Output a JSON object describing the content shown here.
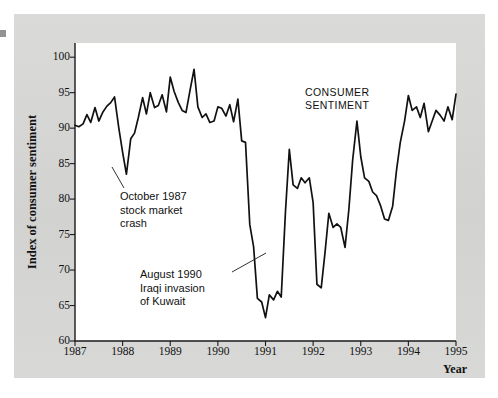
{
  "figure": {
    "background_color": "#d6d6d4",
    "plot_background_color": "#ffffff",
    "line_color": "#111111"
  },
  "annotations": {
    "crash_1987": "October 1987\nstock market\ncrash",
    "crash_1987_lines": [
      "October 1987",
      "stock market",
      "crash"
    ],
    "gulf_1990": "August 1990\nIraqi invasion\nof Kuwait",
    "gulf_1990_lines": [
      "August 1990",
      "Iraqi invasion",
      "of Kuwait"
    ],
    "series_label_lines": [
      "CONSUMER",
      "SENTIMENT"
    ]
  },
  "chart_data": {
    "type": "line",
    "title": "",
    "xlabel": "Year",
    "ylabel": "Index of consumer sentiment",
    "series_name": "CONSUMER SENTIMENT",
    "xlim": [
      1987.0,
      1995.0
    ],
    "ylim": [
      60,
      102
    ],
    "ytick_labels": [
      "60",
      "65",
      "70",
      "75",
      "80",
      "85",
      "90",
      "95",
      "100"
    ],
    "yticks": [
      60,
      65,
      70,
      75,
      80,
      85,
      90,
      95,
      100
    ],
    "xtick_labels": [
      "1987",
      "1988",
      "1989",
      "1990",
      "1991",
      "1992",
      "1993",
      "1994",
      "1995"
    ],
    "xticks": [
      1987,
      1988,
      1989,
      1990,
      1991,
      1992,
      1993,
      1994,
      1995
    ],
    "grid": false,
    "legend": "inline-label",
    "x": [
      1987.0,
      1987.08,
      1987.17,
      1987.25,
      1987.33,
      1987.42,
      1987.5,
      1987.58,
      1987.67,
      1987.75,
      1987.83,
      1987.92,
      1988.0,
      1988.08,
      1988.17,
      1988.25,
      1988.33,
      1988.42,
      1988.5,
      1988.58,
      1988.67,
      1988.75,
      1988.83,
      1988.92,
      1989.0,
      1989.08,
      1989.17,
      1989.25,
      1989.33,
      1989.42,
      1989.5,
      1989.58,
      1989.67,
      1989.75,
      1989.83,
      1989.92,
      1990.0,
      1990.08,
      1990.17,
      1990.25,
      1990.33,
      1990.42,
      1990.5,
      1990.58,
      1990.67,
      1990.75,
      1990.83,
      1990.92,
      1991.0,
      1991.08,
      1991.17,
      1991.25,
      1991.33,
      1991.42,
      1991.5,
      1991.58,
      1991.67,
      1991.75,
      1991.83,
      1991.92,
      1992.0,
      1992.08,
      1992.17,
      1992.25,
      1992.33,
      1992.42,
      1992.5,
      1992.58,
      1992.67,
      1992.75,
      1992.83,
      1992.92,
      1993.0,
      1993.08,
      1993.17,
      1993.25,
      1993.33,
      1993.42,
      1993.5,
      1993.58,
      1993.67,
      1993.75,
      1993.83,
      1993.92,
      1994.0,
      1994.08,
      1994.17,
      1994.25,
      1994.33,
      1994.42,
      1994.5,
      1994.58,
      1994.67,
      1994.75,
      1994.83,
      1994.92,
      1995.0
    ],
    "values": [
      90.4,
      90.2,
      90.6,
      91.9,
      90.8,
      92.9,
      91.0,
      92.2,
      93.1,
      93.6,
      94.4,
      90.0,
      86.6,
      83.5,
      88.5,
      89.3,
      91.5,
      94.3,
      92.0,
      95.0,
      92.9,
      93.2,
      94.7,
      92.3,
      97.2,
      95.2,
      93.6,
      92.5,
      92.2,
      95.5,
      98.3,
      93.0,
      91.5,
      92.0,
      90.8,
      91.0,
      93.0,
      92.8,
      91.7,
      93.3,
      90.9,
      94.1,
      88.2,
      88.0,
      76.4,
      73.3,
      66.0,
      65.5,
      63.3,
      66.5,
      65.8,
      67.0,
      66.2,
      78.3,
      87.0,
      82.0,
      81.5,
      83.0,
      82.3,
      83.0,
      79.5,
      68.0,
      67.5,
      72.5,
      78.0,
      76.0,
      76.5,
      76.0,
      73.2,
      78.5,
      85.5,
      91.0,
      86.0,
      83.0,
      82.5,
      81.0,
      80.5,
      79.0,
      77.2,
      77.0,
      79.0,
      84.0,
      88.0,
      91.0,
      94.6,
      92.5,
      93.0,
      91.5,
      93.5,
      89.5,
      91.0,
      92.5,
      91.8,
      91.0,
      93.0,
      91.2,
      94.8
    ]
  }
}
